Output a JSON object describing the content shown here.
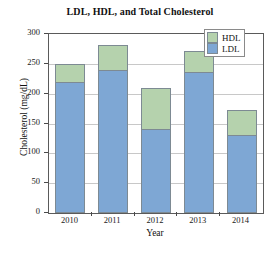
{
  "chart_data": {
    "type": "bar",
    "stacked": true,
    "title": "LDL, HDL, and Total Cholesterol",
    "xlabel": "Year",
    "ylabel": "Cholesterol (mg/dL)",
    "categories": [
      "2010",
      "2011",
      "2012",
      "2013",
      "2014"
    ],
    "series": [
      {
        "name": "LDL",
        "color": "#7ea7d4",
        "values": [
          220,
          240,
          140,
          237,
          131
        ]
      },
      {
        "name": "HDL",
        "color": "#b5d2ad",
        "values": [
          30,
          41,
          70,
          34,
          41
        ]
      }
    ],
    "totals": [
      250,
      281,
      210,
      271,
      172
    ],
    "ylim": [
      0,
      300
    ],
    "yticks": [
      0,
      50,
      100,
      150,
      200,
      250,
      300
    ],
    "ytick_labels": [
      "0",
      "50",
      "100",
      "150",
      "200",
      "250",
      "300"
    ],
    "grid": "horizontal",
    "legend_position": "top-right",
    "legend_entries": [
      "HDL",
      "LDL"
    ]
  }
}
